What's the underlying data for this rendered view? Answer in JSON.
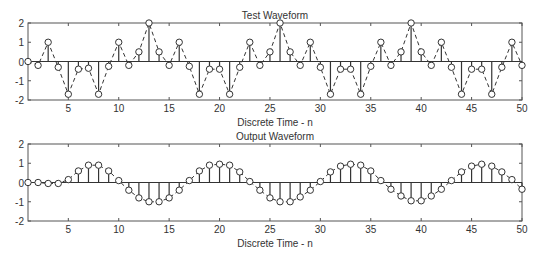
{
  "figure": {
    "background": "#ffffff",
    "line_color": "#333333",
    "axis_color": "#555555"
  },
  "chart_data": [
    {
      "type": "stem",
      "title": "Test Waveform",
      "xlabel": "Discrete Time - n",
      "ylabel": "",
      "xlim": [
        1,
        50
      ],
      "ylim": [
        -2,
        2
      ],
      "xticks": [
        5,
        10,
        15,
        20,
        25,
        30,
        35,
        40,
        45,
        50
      ],
      "yticks": [
        -2,
        -1,
        0,
        1,
        2
      ],
      "ytick_labels": [
        "-2",
        "-1",
        "0",
        "1",
        "2"
      ],
      "grid": false,
      "connector": "dashed",
      "marker": "circle",
      "x": [
        1,
        2,
        3,
        4,
        5,
        6,
        7,
        8,
        9,
        10,
        11,
        12,
        13,
        14,
        15,
        16,
        17,
        18,
        19,
        20,
        21,
        22,
        23,
        24,
        25,
        26,
        27,
        28,
        29,
        30,
        31,
        32,
        33,
        34,
        35,
        36,
        37,
        38,
        39,
        40,
        41,
        42,
        43,
        44,
        45,
        46,
        47,
        48,
        49,
        50
      ],
      "values": [
        0,
        -0.2,
        1,
        -0.3,
        -1.7,
        -0.4,
        -0.35,
        -1.7,
        -0.25,
        1,
        -0.2,
        0.5,
        2,
        0.5,
        -0.2,
        1,
        -0.25,
        -1.7,
        -0.4,
        -0.4,
        -1.7,
        -0.3,
        1,
        -0.2,
        0.5,
        2,
        0.5,
        -0.2,
        1,
        -0.3,
        -1.7,
        -0.4,
        -0.4,
        -1.7,
        -0.25,
        1,
        -0.2,
        0.5,
        2,
        0.5,
        -0.2,
        1,
        -0.3,
        -1.7,
        -0.4,
        -0.4,
        -1.7,
        -0.3,
        1,
        -0.2
      ],
      "box": {
        "x0": 28,
        "x1": 522,
        "y0": 23,
        "y1": 100
      }
    },
    {
      "type": "stem",
      "title": "Output Waveform",
      "xlabel": "Discrete Time - n",
      "ylabel": "",
      "xlim": [
        1,
        50
      ],
      "ylim": [
        -2,
        2
      ],
      "xticks": [
        5,
        10,
        15,
        20,
        25,
        30,
        35,
        40,
        45,
        50
      ],
      "yticks": [
        -2,
        -1,
        0,
        1,
        2
      ],
      "ytick_labels": [
        "-2",
        "-1",
        "0",
        "1",
        "2"
      ],
      "grid": false,
      "connector": "dashed",
      "marker": "circle",
      "x": [
        1,
        2,
        3,
        4,
        5,
        6,
        7,
        8,
        9,
        10,
        11,
        12,
        13,
        14,
        15,
        16,
        17,
        18,
        19,
        20,
        21,
        22,
        23,
        24,
        25,
        26,
        27,
        28,
        29,
        30,
        31,
        32,
        33,
        34,
        35,
        36,
        37,
        38,
        39,
        40,
        41,
        42,
        43,
        44,
        45,
        46,
        47,
        48,
        49,
        50
      ],
      "values": [
        0,
        0,
        -0.05,
        -0.05,
        0.15,
        0.6,
        0.9,
        0.9,
        0.6,
        0.1,
        -0.4,
        -0.8,
        -1.0,
        -1.0,
        -0.8,
        -0.4,
        0.1,
        0.6,
        0.9,
        0.95,
        0.9,
        0.55,
        0.05,
        -0.4,
        -0.8,
        -1.0,
        -1.0,
        -0.75,
        -0.4,
        0.05,
        0.55,
        0.85,
        0.95,
        0.9,
        0.6,
        0.1,
        -0.35,
        -0.7,
        -0.95,
        -0.95,
        -0.7,
        -0.35,
        0.1,
        0.55,
        0.85,
        0.95,
        0.85,
        0.55,
        0.15,
        -0.35
      ],
      "box": {
        "x0": 28,
        "x1": 522,
        "y0": 144,
        "y1": 221
      }
    }
  ]
}
